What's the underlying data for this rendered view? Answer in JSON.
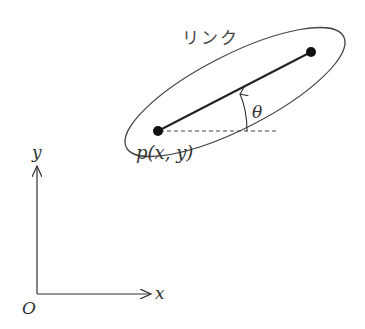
{
  "diagram": {
    "link_label": "リンク",
    "point_label": "p(x, y)",
    "angle_label": "θ",
    "axes": {
      "x_label": "x",
      "y_label": "y",
      "origin_label": "O"
    },
    "colors": {
      "stroke": "#333333",
      "point": "#111111",
      "background": "#ffffff"
    }
  }
}
